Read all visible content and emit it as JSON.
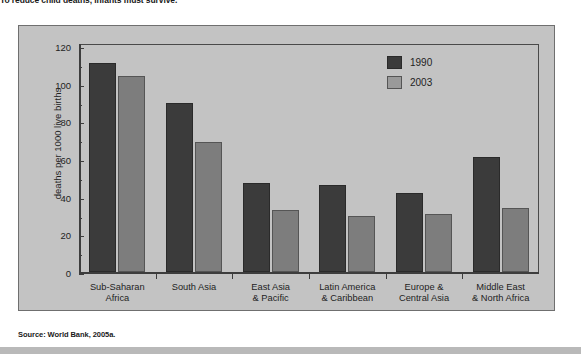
{
  "headline": "To reduce child deaths, infants must survive.",
  "source": "Source: World Bank, 2005a.",
  "colors": {
    "panel_background": "#c3c3c3",
    "series_1990": "#3b3b3b",
    "series_2003": "#7d7d7d",
    "axis": "#3d3d3d",
    "text": "#1e1e1e",
    "bottom_rule": "#b9b9b9"
  },
  "legend": {
    "position": "top-right",
    "entries": [
      {
        "label": "1990",
        "swatch": "legend-swatch-1990"
      },
      {
        "label": "2003",
        "swatch": "legend-swatch-2003"
      }
    ]
  },
  "chart_data": {
    "type": "bar",
    "title": "",
    "xlabel": "",
    "ylabel": "deaths  per 1000 live births",
    "ylim": [
      0,
      120
    ],
    "yticks": [
      0,
      20,
      40,
      60,
      80,
      100,
      120
    ],
    "ytick_labels": [
      "0",
      "20",
      "40",
      "60",
      "80",
      "100",
      "120"
    ],
    "grid": false,
    "categories": [
      "Sub-Saharan\nAfrica",
      "South Asia",
      "East Asia\n& Pacific",
      "Latin America\n& Caribbean",
      "Europe &\nCentral Asia",
      "Middle East\n& North Africa"
    ],
    "category_lines": [
      [
        "Sub-Saharan",
        "Africa"
      ],
      [
        "South Asia",
        ""
      ],
      [
        "East Asia",
        "& Pacific"
      ],
      [
        "Latin America",
        "& Caribbean"
      ],
      [
        "Europe &",
        "Central Asia"
      ],
      [
        "Middle East",
        "& North Africa"
      ]
    ],
    "series": [
      {
        "name": "1990",
        "color": "#3b3b3b",
        "values": [
          111,
          90,
          47,
          46,
          42,
          61
        ]
      },
      {
        "name": "2003",
        "color": "#7d7d7d",
        "values": [
          104,
          69,
          33,
          30,
          31,
          34
        ]
      }
    ]
  }
}
